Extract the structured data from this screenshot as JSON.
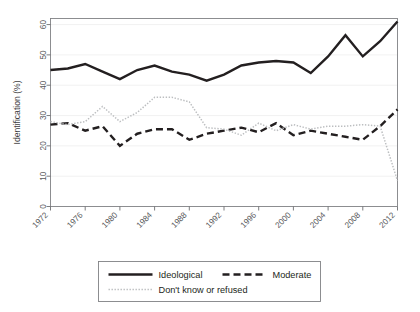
{
  "chart_data": {
    "type": "line",
    "title": "",
    "subtitle": "",
    "xlabel": "",
    "ylabel": "Identification (%)",
    "xlim": [
      1972,
      2012
    ],
    "ylim": [
      0,
      62
    ],
    "yticks": [
      0,
      10,
      20,
      30,
      40,
      50,
      60
    ],
    "xticks": [
      1972,
      1976,
      1980,
      1984,
      1988,
      1992,
      1996,
      2000,
      2004,
      2008,
      2012
    ],
    "grid": "horizontal-faint",
    "legend_position": "bottom",
    "x": [
      1972,
      1974,
      1976,
      1978,
      1980,
      1982,
      1984,
      1986,
      1988,
      1990,
      1992,
      1994,
      1996,
      1998,
      2000,
      2002,
      2004,
      2006,
      2008,
      2010,
      2012
    ],
    "series": [
      {
        "name": "Ideological",
        "style": "solid",
        "color": "#231f20",
        "values": [
          45.0,
          45.5,
          47.0,
          44.5,
          42.0,
          45.0,
          46.5,
          44.5,
          43.5,
          41.5,
          43.5,
          46.5,
          47.5,
          48.0,
          47.5,
          44.0,
          49.5,
          56.5,
          49.5,
          54.5,
          61.0
        ]
      },
      {
        "name": "Moderate",
        "style": "dashed",
        "color": "#231f20",
        "values": [
          27.0,
          27.5,
          25.0,
          26.5,
          20.0,
          24.0,
          25.5,
          25.5,
          22.0,
          24.0,
          25.0,
          26.0,
          24.5,
          27.5,
          23.5,
          25.0,
          24.0,
          23.0,
          22.0,
          26.5,
          32.0
        ]
      },
      {
        "name": "Don't know or refused",
        "style": "dotted",
        "color": "#bcbec0",
        "values": [
          28.0,
          27.0,
          28.0,
          33.0,
          28.0,
          31.0,
          36.0,
          36.0,
          34.5,
          26.0,
          25.5,
          23.5,
          27.5,
          25.0,
          27.0,
          25.5,
          26.5,
          26.5,
          27.0,
          26.5,
          8.5
        ]
      }
    ]
  },
  "axes": {
    "y_title": "Identification (%)",
    "y_tick_labels": [
      "0",
      "10",
      "20",
      "30",
      "40",
      "50",
      "60"
    ],
    "x_tick_labels": [
      "1972",
      "1976",
      "1980",
      "1984",
      "1988",
      "1992",
      "1996",
      "2000",
      "2004",
      "2008",
      "2012"
    ]
  },
  "legend": {
    "entries": [
      {
        "label": "Ideological",
        "style": "solid"
      },
      {
        "label": "Moderate",
        "style": "dashed"
      },
      {
        "label": "Don't know or refused",
        "style": "dotted"
      }
    ]
  }
}
